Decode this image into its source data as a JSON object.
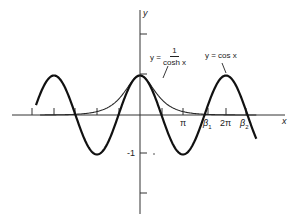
{
  "chart_data": {
    "type": "line",
    "title": "",
    "xlabel": "x",
    "ylabel": "y",
    "xlim": [
      -7.6,
      10.5
    ],
    "ylim": [
      -2.5,
      2.6
    ],
    "grid": false,
    "legend": "none (inline curve labels)",
    "x_ticks": [
      "π",
      "β1",
      "2π",
      "β2"
    ],
    "x_tick_values": [
      3.1416,
      4.694,
      6.2832,
      7.855
    ],
    "y_ticks": [
      "-1"
    ],
    "y_tick_values": [
      -1
    ],
    "series": [
      {
        "name": "y = cos x",
        "function": "cos(x)",
        "x_range": [
          -7.6,
          8.5
        ],
        "stroke": "bold"
      },
      {
        "name": "y = 1/cosh x",
        "function": "1/cosh(x)",
        "x_range": [
          -7.3,
          8.5
        ],
        "stroke": "thin"
      }
    ],
    "annotations": [
      {
        "text": "β1",
        "meaning": "first positive intersection of cos x and 1/cosh x",
        "x": 4.694
      },
      {
        "text": "β2",
        "meaning": "second positive intersection",
        "x": 7.855
      }
    ]
  },
  "labels": {
    "y_axis": "y",
    "x_axis": "x",
    "pi": "π",
    "beta1": "β",
    "beta1_sub": "1",
    "two_pi": "2π",
    "beta2": "β",
    "beta2_sub": "2",
    "neg_one": "-1",
    "cosh_prefix": "y =",
    "cosh_num": "1",
    "cosh_den": "cosh x",
    "cos_label": "y = cos x"
  },
  "colors": {
    "axis": "#333333",
    "curve": "#1a1a1a",
    "text": "#222222"
  }
}
